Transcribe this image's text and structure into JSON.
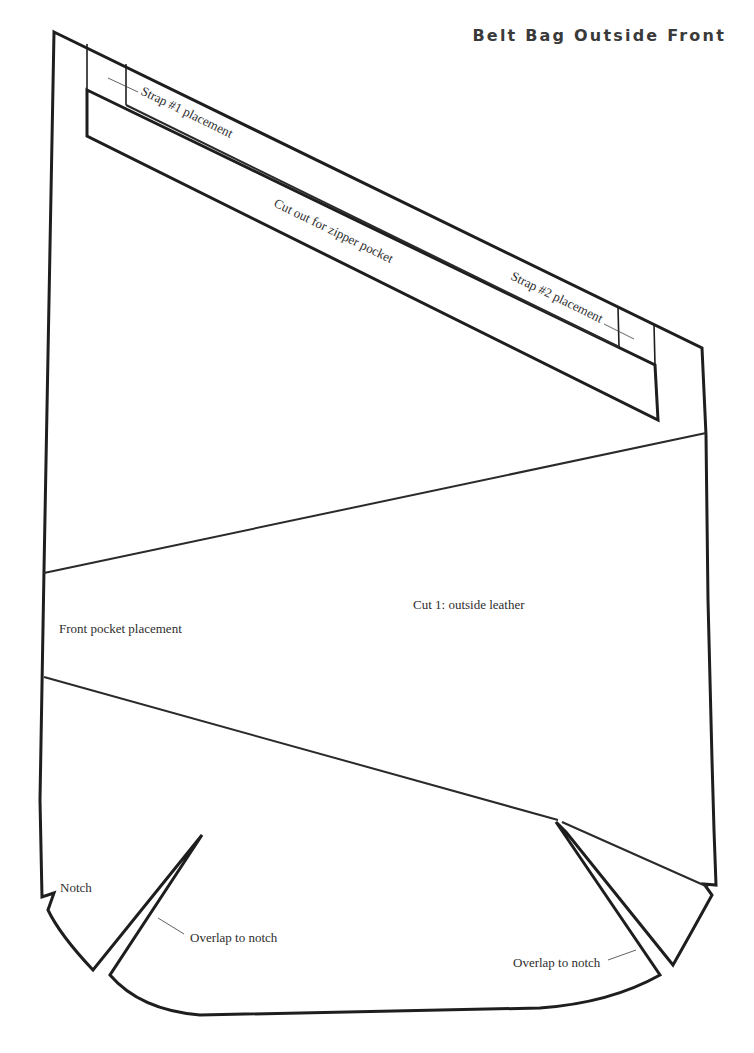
{
  "title": "Belt Bag Outside Front",
  "colors": {
    "line": "#1e1e1e",
    "text": "#2e2e2e",
    "title": "#3a3a3a",
    "background": "#ffffff"
  },
  "labels": {
    "strap1": "Strap #1 placement",
    "zipper_cutout": "Cut out for zipper pocket",
    "strap2": "Strap #2 placement",
    "cut_instruction": "Cut 1: outside leather",
    "front_pocket": "Front pocket placement",
    "notch": "Notch",
    "overlap_left": "Overlap to notch",
    "overlap_right": "Overlap to notch"
  },
  "pattern_piece": {
    "name": "Belt Bag Outside Front",
    "cut_quantity": 1,
    "material": "outside leather",
    "markings": [
      "Strap #1 placement",
      "Cut out for zipper pocket",
      "Strap #2 placement",
      "Front pocket placement",
      "Notch",
      "Overlap to notch",
      "Overlap to notch"
    ]
  }
}
